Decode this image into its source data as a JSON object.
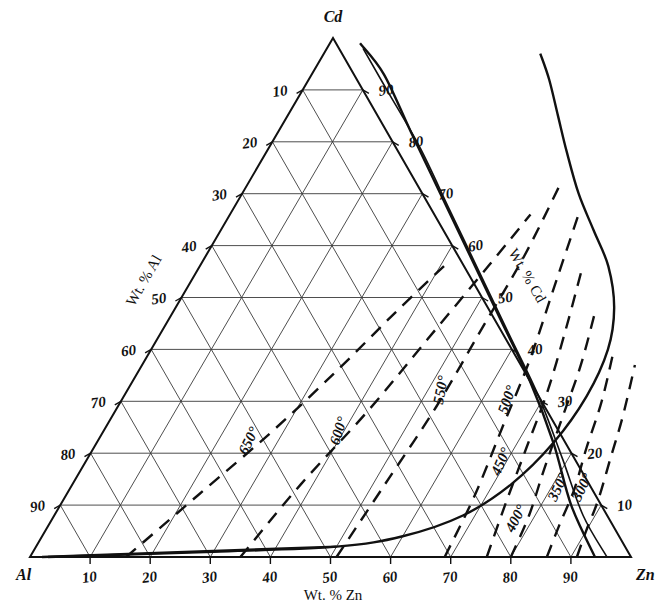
{
  "figure": {
    "kind": "ternary-phase-diagram",
    "system": "Al-Zn-Cd"
  },
  "vertices": {
    "top": "Cd",
    "bottom_left": "Al",
    "bottom_right": "Zn"
  },
  "axes": {
    "bottom": {
      "title": "Wt. % Zn",
      "ticks": [
        "10",
        "20",
        "30",
        "40",
        "50",
        "60",
        "70",
        "80",
        "90"
      ]
    },
    "left": {
      "title": "Wt. % Al",
      "ticks": [
        "10",
        "20",
        "30",
        "40",
        "50",
        "60",
        "70",
        "80",
        "90"
      ]
    },
    "right": {
      "title": "Wt. % Cd",
      "ticks": [
        "90",
        "80",
        "70",
        "60",
        "50",
        "40",
        "30",
        "20",
        "10"
      ]
    }
  },
  "isotherms": [
    {
      "label": "650°",
      "value": 650
    },
    {
      "label": "600°",
      "value": 600
    },
    {
      "label": "550°",
      "value": 550
    },
    {
      "label": "500°",
      "value": 500
    },
    {
      "label": "450°",
      "value": 450
    },
    {
      "label": "400°",
      "value": 400
    },
    {
      "label": "350°",
      "value": 350
    },
    {
      "label": "300°",
      "value": 300
    }
  ],
  "chart_data": {
    "type": "line",
    "title": "",
    "xlabel": "Wt. % Zn",
    "ylabel": "Wt. % Al",
    "zlabel": "Wt. % Cd",
    "components": [
      "Al",
      "Zn",
      "Cd"
    ],
    "axis_range": [
      0,
      100
    ],
    "tick_step": 10,
    "grid": true,
    "legend": "none",
    "series": [
      {
        "name": "650° isotherm",
        "style": "dashed",
        "points_zn_cd": [
          [
            16,
            0
          ],
          [
            22,
            12
          ],
          [
            28,
            24
          ],
          [
            33,
            36
          ],
          [
            37,
            47
          ],
          [
            41,
            57
          ]
        ]
      },
      {
        "name": "600° isotherm",
        "style": "dashed",
        "points_zn_cd": [
          [
            35,
            0
          ],
          [
            38,
            14
          ],
          [
            42,
            28
          ],
          [
            45,
            42
          ],
          [
            48,
            56
          ],
          [
            50,
            66
          ]
        ]
      },
      {
        "name": "550° isotherm",
        "style": "dashed",
        "points_zn_cd": [
          [
            51,
            0
          ],
          [
            52,
            14
          ],
          [
            53,
            29
          ],
          [
            53,
            44
          ],
          [
            53,
            58
          ],
          [
            52,
            72
          ]
        ]
      },
      {
        "name": "500° isotherm",
        "style": "dashed",
        "points_zn_cd": [
          [
            69,
            0
          ],
          [
            68,
            12
          ],
          [
            66,
            25
          ],
          [
            64,
            38
          ],
          [
            61,
            52
          ],
          [
            58,
            66
          ]
        ]
      },
      {
        "name": "450° isotherm",
        "style": "dashed",
        "points_zn_cd": [
          [
            76,
            0
          ],
          [
            74,
            10
          ],
          [
            72,
            21
          ],
          [
            70,
            32
          ],
          [
            67,
            44
          ],
          [
            64,
            55
          ]
        ]
      },
      {
        "name": "400° isotherm",
        "style": "dashed",
        "points_zn_cd": [
          [
            80,
            0
          ],
          [
            79,
            8
          ],
          [
            77,
            17
          ],
          [
            75,
            27
          ],
          [
            73,
            37
          ],
          [
            70,
            48
          ]
        ]
      },
      {
        "name": "350° isotherm",
        "style": "dashed",
        "points_zn_cd": [
          [
            86,
            0
          ],
          [
            85,
            6
          ],
          [
            84,
            13
          ],
          [
            82,
            21
          ],
          [
            80,
            30
          ],
          [
            77,
            40
          ]
        ]
      },
      {
        "name": "300° isotherm",
        "style": "dashed",
        "points_zn_cd": [
          [
            91,
            0
          ],
          [
            90,
            5
          ],
          [
            89,
            11
          ],
          [
            87,
            19
          ],
          [
            85,
            27
          ],
          [
            82,
            37
          ]
        ]
      },
      {
        "name": "miscibility gap boundary",
        "style": "solid",
        "points_zn_cd": [
          [
            3,
            0
          ],
          [
            30,
            1
          ],
          [
            50,
            2
          ],
          [
            60,
            4
          ],
          [
            68,
            8
          ],
          [
            73,
            14
          ],
          [
            76,
            22
          ],
          [
            77,
            31
          ],
          [
            76,
            40
          ],
          [
            73,
            48
          ],
          [
            68,
            56
          ],
          [
            62,
            63
          ],
          [
            56,
            70
          ],
          [
            50,
            78
          ],
          [
            45,
            85
          ],
          [
            40,
            92
          ],
          [
            36,
            97
          ]
        ]
      },
      {
        "name": "monotectic horizontal",
        "style": "solid",
        "points_zn_cd": [
          [
            2,
            0
          ],
          [
            50,
            2
          ]
        ]
      },
      {
        "name": "liquidus right edge",
        "style": "solid",
        "points_zn_cd": [
          [
            94,
            0
          ],
          [
            85,
            10
          ],
          [
            76,
            22
          ],
          [
            66,
            34
          ],
          [
            55,
            46
          ],
          [
            44,
            58
          ],
          [
            33,
            70
          ],
          [
            22,
            82
          ],
          [
            12,
            93
          ],
          [
            5,
            99
          ]
        ]
      }
    ],
    "annotations": [
      {
        "text": "Cd",
        "position": "top-vertex"
      },
      {
        "text": "Al",
        "position": "bottom-left-vertex"
      },
      {
        "text": "Zn",
        "position": "bottom-right-vertex"
      }
    ]
  }
}
